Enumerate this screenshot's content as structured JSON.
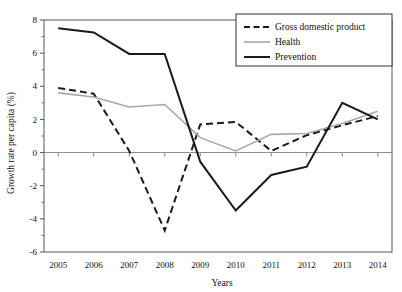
{
  "chart_data": {
    "type": "line",
    "title": "",
    "xlabel": "Years",
    "ylabel": "Growth rate per capita (%)",
    "categories": [
      2005,
      2006,
      2007,
      2008,
      2009,
      2010,
      2011,
      2012,
      2013,
      2014
    ],
    "xticklabels": [
      "2005",
      "2006",
      "2007",
      "2008",
      "2009",
      "2010",
      "2011",
      "2012",
      "2013",
      "2014"
    ],
    "yticklabels": [
      "8",
      "6",
      "4",
      "2",
      "0",
      "-2",
      "-4",
      "-6"
    ],
    "yticks": [
      8,
      6,
      4,
      2,
      0,
      -2,
      -4,
      -6
    ],
    "ylim": [
      -6,
      8
    ],
    "xlim": [
      2004.6,
      2014.4
    ],
    "grid": false,
    "zero_line": true,
    "legend_position": "top-right",
    "series": [
      {
        "name": "Gross domestic product",
        "color": "#1a1a1a",
        "style": "dashed",
        "width": 2.0,
        "values": [
          3.9,
          3.55,
          0.1,
          -4.7,
          1.7,
          1.85,
          0.1,
          1.05,
          1.65,
          2.2
        ]
      },
      {
        "name": "Health",
        "color": "#a8a8a8",
        "style": "solid",
        "width": 1.6,
        "values": [
          3.6,
          3.35,
          2.75,
          2.9,
          0.9,
          0.1,
          1.1,
          1.15,
          1.75,
          2.5
        ]
      },
      {
        "name": "Prevention",
        "color": "#1a1a1a",
        "style": "solid",
        "width": 2.0,
        "values": [
          7.5,
          7.25,
          5.95,
          5.95,
          -0.55,
          -3.5,
          -1.35,
          -0.85,
          3.0,
          2.0
        ]
      }
    ]
  },
  "axes": {
    "frame_color": "#555555",
    "zero_line_color": "#888888"
  }
}
